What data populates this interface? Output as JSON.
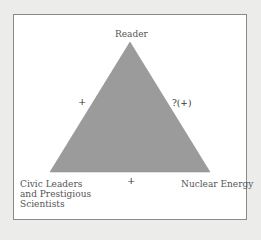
{
  "diagram": {
    "type": "balance-triangle",
    "fill_color": "#9b9b9b",
    "nodes": {
      "top": "Reader",
      "bottom_left": [
        "Civic Leaders",
        "and Prestigious",
        "Scientists"
      ],
      "bottom_right": "Nuclear Energy"
    },
    "edges": {
      "left": "+",
      "right": "?(+)",
      "bottom": "+"
    }
  }
}
